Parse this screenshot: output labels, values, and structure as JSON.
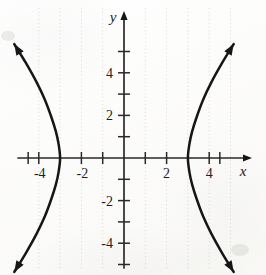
{
  "figure": {
    "background_color": "#fbfbf9",
    "curve_color": "#161616",
    "axis_color": "#2a2a2a",
    "grid_color": "#c9c6bd"
  },
  "axes": {
    "x_axis_label": "x",
    "y_axis_label": "y",
    "origin_px": {
      "x": 124,
      "y": 158
    },
    "px_per_unit": 21.3,
    "x_tick_labels": [
      "-4",
      "-2",
      "2",
      "4"
    ],
    "y_tick_labels": [
      "4",
      "2",
      "-2",
      "-4"
    ],
    "x_ticks_values": [
      -4.5,
      -4,
      -3,
      -2,
      -1,
      1,
      2,
      3,
      4,
      4.5
    ],
    "y_ticks_values": [
      5,
      4,
      3,
      2,
      1,
      -1,
      -2,
      -3,
      -4,
      -5
    ],
    "x_label_anchors": [
      {
        "text": "-4",
        "value": -4
      },
      {
        "text": "-2",
        "value": -2
      },
      {
        "text": "2",
        "value": 2
      },
      {
        "text": "4",
        "value": 4
      }
    ],
    "y_label_anchors": [
      {
        "text": "4",
        "value": 4
      },
      {
        "text": "2",
        "value": 2
      },
      {
        "text": "-2",
        "value": -2
      },
      {
        "text": "-4",
        "value": -4
      }
    ]
  },
  "chart_data": {
    "type": "line",
    "xlabel": "x",
    "ylabel": "y",
    "xlim": [
      -5.8,
      6.6
    ],
    "ylim": [
      -5.6,
      5.9
    ],
    "grid": "dotted-vertical",
    "legend": "none",
    "equation": "x^2/9 - y^2/16 = 1",
    "vertices": [
      [
        -3,
        0
      ],
      [
        3,
        0
      ]
    ],
    "center": [
      0,
      0
    ],
    "a": 3,
    "b": 4,
    "orientation": "horizontal",
    "series": [
      {
        "name": "left-branch",
        "comment": "x = -3*cosh(t), y = 4*sinh(t)",
        "points": [
          [
            -5.15,
            -5.35
          ],
          [
            -4.6,
            -4.45
          ],
          [
            -4.1,
            -3.55
          ],
          [
            -3.72,
            -2.75
          ],
          [
            -3.42,
            -1.95
          ],
          [
            -3.2,
            -1.25
          ],
          [
            -3.07,
            -0.65
          ],
          [
            -3.0,
            0.0
          ],
          [
            -3.07,
            0.65
          ],
          [
            -3.2,
            1.25
          ],
          [
            -3.42,
            1.95
          ],
          [
            -3.72,
            2.75
          ],
          [
            -4.1,
            3.55
          ],
          [
            -4.6,
            4.45
          ],
          [
            -5.15,
            5.35
          ]
        ]
      },
      {
        "name": "right-branch",
        "comment": "x = 3*cosh(t), y = 4*sinh(t)",
        "points": [
          [
            5.15,
            -5.35
          ],
          [
            4.6,
            -4.45
          ],
          [
            4.1,
            -3.55
          ],
          [
            3.72,
            -2.75
          ],
          [
            3.42,
            -1.95
          ],
          [
            3.2,
            -1.25
          ],
          [
            3.07,
            -0.65
          ],
          [
            3.0,
            0.0
          ],
          [
            3.07,
            0.65
          ],
          [
            3.2,
            1.25
          ],
          [
            3.42,
            1.95
          ],
          [
            3.72,
            2.75
          ],
          [
            4.1,
            3.55
          ],
          [
            4.6,
            4.45
          ],
          [
            5.15,
            5.35
          ]
        ]
      }
    ],
    "arrow_tips": [
      {
        "name": "left-branch-upper",
        "x": -5.15,
        "y": 5.35
      },
      {
        "name": "left-branch-lower",
        "x": -5.15,
        "y": -5.35
      },
      {
        "name": "right-branch-upper",
        "x": 5.15,
        "y": 5.35
      },
      {
        "name": "right-branch-lower",
        "x": 5.15,
        "y": -5.35
      }
    ],
    "gridline_x_values": [
      -4,
      -3,
      -2,
      -1,
      1,
      2,
      3,
      4,
      5
    ],
    "gridline_y_values": []
  }
}
